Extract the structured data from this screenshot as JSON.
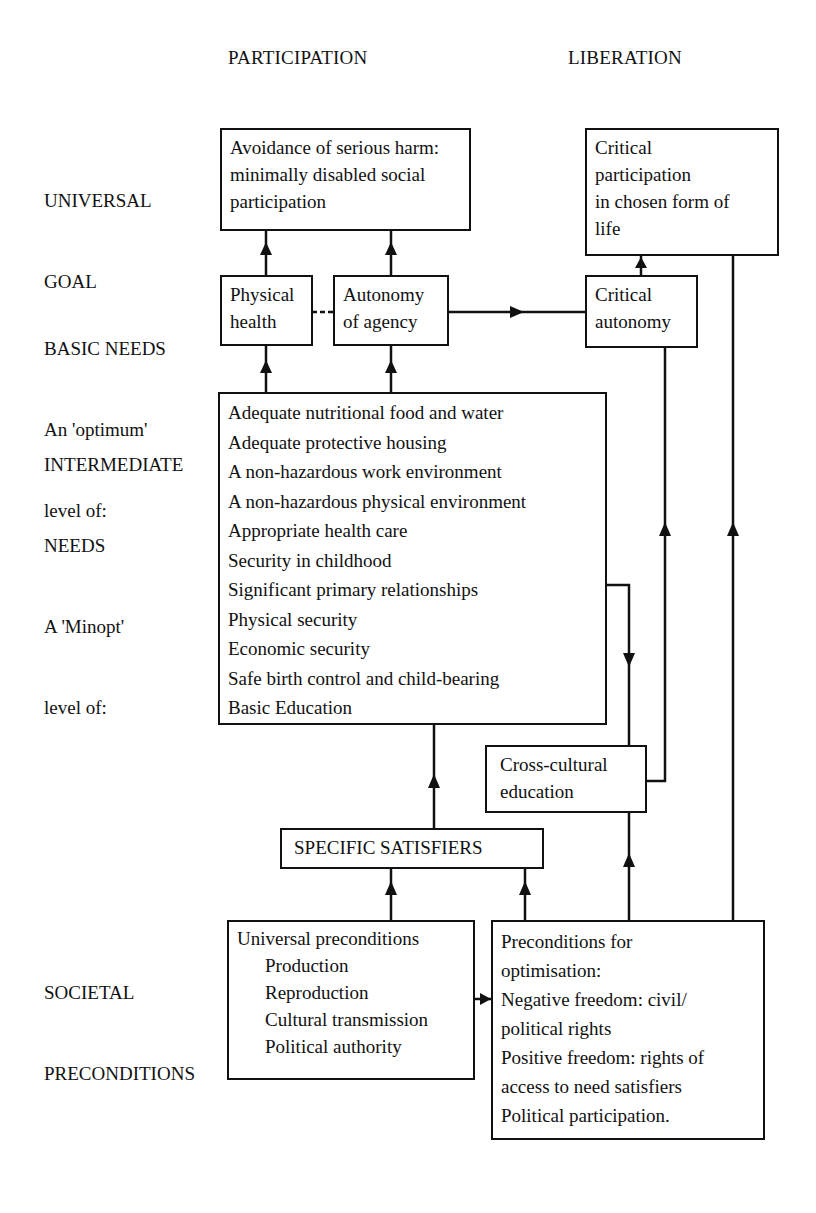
{
  "columns": {
    "participation": "PARTICIPATION",
    "liberation": "LIBERATION"
  },
  "row_labels": {
    "universal_goal": [
      "UNIVERSAL",
      "GOAL"
    ],
    "basic_needs": [
      "BASIC NEEDS",
      "An 'optimum'",
      "level of:"
    ],
    "intermediate_needs": [
      "INTERMEDIATE",
      "NEEDS",
      "A 'Minopt'",
      "level of:"
    ],
    "societal_preconditions": [
      "SOCIETAL",
      "PRECONDITIONS"
    ]
  },
  "boxes": {
    "avoidance_of_harm": [
      "Avoidance of serious harm:",
      "minimally disabled social",
      "participation"
    ],
    "critical_participation": [
      "Critical",
      "participation",
      "in chosen form of",
      "life"
    ],
    "physical_health": [
      "Physical",
      "health"
    ],
    "autonomy_of_agency": [
      "Autonomy",
      "of agency"
    ],
    "critical_autonomy": [
      "Critical",
      "autonomy"
    ],
    "intermediate_needs_list": [
      "Adequate nutritional food and water",
      "Adequate protective housing",
      "A non-hazardous work environment",
      "A non-hazardous physical environment",
      "Appropriate health care",
      "Security in childhood",
      "Significant primary relationships",
      "Physical security",
      "Economic security",
      "Safe birth control and child-bearing",
      "Basic Education"
    ],
    "cross_cultural_education": [
      "Cross-cultural",
      "education"
    ],
    "specific_satisfiers": "SPECIFIC SATISFIERS",
    "universal_preconditions": {
      "title": "Universal preconditions",
      "items": [
        "Production",
        "Reproduction",
        "Cultural transmission",
        "Political authority"
      ]
    },
    "preconditions_for_optimisation": [
      "Preconditions for",
      "optimisation:",
      "Negative freedom: civil/",
      "political rights",
      "Positive freedom: rights of",
      "access to need satisfiers",
      "Political participation."
    ]
  },
  "connectors": [
    {
      "from": "physical_health",
      "to": "avoidance_of_harm",
      "type": "arrow"
    },
    {
      "from": "autonomy_of_agency",
      "to": "avoidance_of_harm",
      "type": "arrow"
    },
    {
      "from": "physical_health",
      "to": "autonomy_of_agency",
      "type": "dashed"
    },
    {
      "from": "autonomy_of_agency",
      "to": "critical_autonomy",
      "type": "arrow"
    },
    {
      "from": "critical_autonomy",
      "to": "critical_participation",
      "type": "arrow"
    },
    {
      "from": "intermediate_needs_list",
      "to": "physical_health",
      "type": "arrow"
    },
    {
      "from": "intermediate_needs_list",
      "to": "autonomy_of_agency",
      "type": "arrow"
    },
    {
      "from": "intermediate_needs_list",
      "to": "cross_cultural_education",
      "type": "arrow"
    },
    {
      "from": "cross_cultural_education",
      "to": "critical_autonomy",
      "type": "arrow"
    },
    {
      "from": "specific_satisfiers",
      "to": "intermediate_needs_list",
      "type": "arrow"
    },
    {
      "from": "universal_preconditions",
      "to": "specific_satisfiers",
      "type": "arrow"
    },
    {
      "from": "preconditions_for_optimisation",
      "to": "specific_satisfiers",
      "type": "arrow"
    },
    {
      "from": "universal_preconditions",
      "to": "preconditions_for_optimisation",
      "type": "arrow"
    },
    {
      "from": "preconditions_for_optimisation",
      "to": "cross_cultural_education",
      "type": "arrow"
    },
    {
      "from": "preconditions_for_optimisation",
      "to": "critical_participation",
      "type": "arrow"
    }
  ]
}
